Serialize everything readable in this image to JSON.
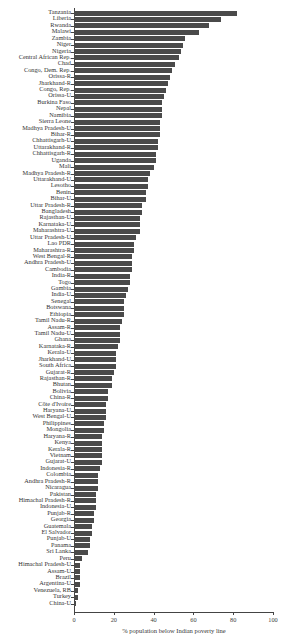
{
  "chart_data": {
    "type": "bar",
    "orientation": "horizontal",
    "title": "",
    "xlabel": "% population below Indian poverty line",
    "ylabel": "",
    "xlim": [
      0,
      100
    ],
    "xticks": [
      0,
      20,
      40,
      60,
      80,
      100
    ],
    "grid": false,
    "legend": null,
    "categories": [
      "Tanzania",
      "Liberia",
      "Rwanda",
      "Malawi",
      "Zambia",
      "Niger",
      "Nigeria",
      "Central African Rep.",
      "Chad",
      "Congo, Dem. Rep.",
      "Orissa-R",
      "Jharkhand-R",
      "Congo, Rep.",
      "Orissa-U",
      "Burkina Faso",
      "Nepal",
      "Namibia",
      "Sierra Leone",
      "Madhya Pradesh-U",
      "Bihar-R",
      "Chhattisgarh-U",
      "Uttarakhand-R",
      "Chhattisgarh-R",
      "Uganda",
      "Mali",
      "Madhya Pradesh-R",
      "Uttarakhand-U",
      "Lesotho",
      "Benin",
      "Bihar-U",
      "Uttar Pradesh-R",
      "Bangladesh",
      "Rajasthan-U",
      "Karnataka-U",
      "Maharashtra-U",
      "Uttar Pradesh-U",
      "Lao PDR",
      "Maharashtra-R",
      "West Bengal-R",
      "Andhra Pradesh-U",
      "Cambodia",
      "India-R",
      "Togo",
      "Gambia",
      "India-U",
      "Senegal",
      "Botswana",
      "Ethiopia",
      "Tamil Nadu-R",
      "Assam-R",
      "Tamil Nadu-U",
      "Ghana",
      "Karnataka-R",
      "Kerala-U",
      "Jharkhand-U",
      "South Africa",
      "Gujarat-R",
      "Rajasthan-R",
      "Bhutan",
      "Bolivia",
      "China-R",
      "Côte d'Ivoire",
      "Haryana-U",
      "West Bengal-U",
      "Philippines",
      "Mongolia",
      "Haryana-R",
      "Kenya",
      "Kerala-R",
      "Vietnam",
      "Gujarat-U",
      "Indonesia-R",
      "Colombia",
      "Andhra Pradesh-R",
      "Nicaragua",
      "Pakistan",
      "Himachal Pradesh-R",
      "Indonesia-U",
      "Punjab-R",
      "Georgia",
      "Guatemala",
      "El Salvador",
      "Punjab-U",
      "Panama",
      "Sri Lanka",
      "Peru",
      "Himachal Pradesh-U",
      "Assam-U",
      "Brazil",
      "Argentina-U",
      "Venezuela, RB",
      "Turkey",
      "China-U"
    ],
    "values": [
      82,
      74,
      68,
      63,
      56,
      55,
      54,
      53,
      51,
      49,
      48,
      47,
      46,
      45,
      44,
      44,
      44,
      43,
      43,
      43,
      42,
      42,
      41,
      41,
      40,
      38,
      37,
      37,
      36,
      36,
      34,
      34,
      33,
      33,
      33,
      31,
      30,
      30,
      29,
      29,
      29,
      28,
      28,
      27,
      26,
      25,
      25,
      25,
      24,
      23,
      23,
      23,
      22,
      21,
      21,
      21,
      20,
      19,
      19,
      17,
      17,
      16,
      16,
      16,
      15,
      15,
      14,
      14,
      14,
      14,
      14,
      13,
      12,
      12,
      12,
      11,
      11,
      11,
      10,
      10,
      9,
      9,
      8,
      8,
      7,
      4,
      3,
      3,
      3,
      3,
      2,
      2,
      1
    ]
  }
}
